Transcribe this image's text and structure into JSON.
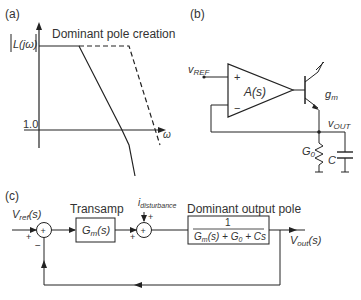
{
  "panel_a": {
    "label": "(a)",
    "title": "Dominant pole creation",
    "y_axis_label": "|L(jω)|",
    "y_tick": "1.0",
    "x_axis_label": "ω"
  },
  "panel_b": {
    "label": "(b)",
    "vref": "v",
    "vref_sub": "REF",
    "amp": "A(s)",
    "plus": "+",
    "minus": "−",
    "gm": "g",
    "gm_sub": "m",
    "vout": "v",
    "vout_sub": "OUT",
    "g0": "G",
    "g0_sub": "0",
    "cap": "C"
  },
  "panel_c": {
    "label": "(c)",
    "vref": "V",
    "vref_sub": "ref",
    "vref_arg": "(s)",
    "transamp_title": "Transamp",
    "gm_block": "G",
    "gm_block_sub": "m",
    "gm_block_arg": "(s)",
    "disturbance": "i",
    "disturbance_sub": "disturbance",
    "pole_title": "Dominant output pole",
    "pole_num": "1",
    "pole_den": "G_m(s) + G_0 + Cs",
    "vout": "V",
    "vout_sub": "out",
    "vout_arg": "(s)",
    "plus": "+",
    "minus": "−"
  }
}
